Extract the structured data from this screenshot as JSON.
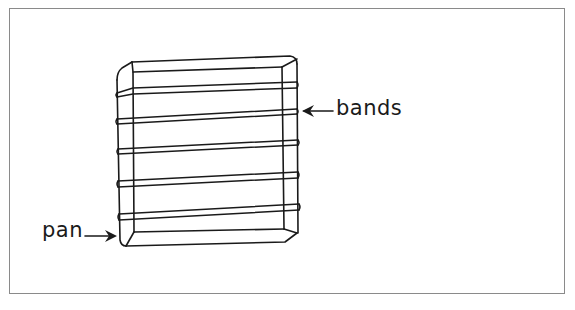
{
  "diagram": {
    "labels": [
      {
        "id": "bands",
        "text": "bands"
      },
      {
        "id": "pan",
        "text": "pan"
      }
    ],
    "band_count": 5,
    "colors": {
      "line": "#1a1a1a",
      "frame": "#8a8a8a",
      "background": "#ffffff"
    }
  }
}
